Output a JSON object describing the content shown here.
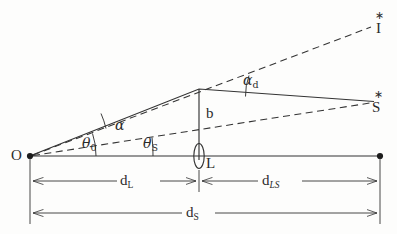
{
  "figure": {
    "type": "gravitational-lensing-geometry-diagram",
    "background_color": "#fdfdfc",
    "stroke_color": "#333333"
  },
  "points": {
    "observer": {
      "label": "O",
      "x": 30,
      "y": 156,
      "marker": "filled-dot"
    },
    "lens": {
      "label": "L",
      "x": 199,
      "y": 156,
      "marker": "ellipse"
    },
    "source": {
      "label": "S",
      "x": 378,
      "y": 100,
      "marker": "star"
    },
    "image": {
      "label": "I",
      "x": 378,
      "y": 22,
      "marker": "star"
    },
    "axis_end": {
      "label": "",
      "x": 380,
      "y": 156,
      "marker": "filled-dot"
    },
    "bend": {
      "label": "",
      "x": 199,
      "y": 89,
      "marker": "none"
    }
  },
  "angles": {
    "alpha": "α",
    "alpha_d_base": "α",
    "alpha_d_sub": "d",
    "theta_0_base": "θ",
    "theta_0_sub": "0",
    "theta_s_base": "θ",
    "theta_s_sub": "S"
  },
  "lengths": {
    "impact_parameter": "b",
    "d_L_base": "d",
    "d_L_sub": "L",
    "d_LS_base": "d",
    "d_LS_sub": "LS",
    "d_S_base": "d",
    "d_S_sub": "S"
  },
  "markers": {
    "star_glyph": "∗"
  },
  "lines": {
    "optic_axis": {
      "style": "solid",
      "from": "observer",
      "to": "axis_end"
    },
    "deflected_ray_in": {
      "style": "solid",
      "from": "observer",
      "to": "bend"
    },
    "deflected_ray_out": {
      "style": "solid",
      "from": "bend",
      "to": "source"
    },
    "true_source_line": {
      "style": "dashed",
      "from": "observer",
      "to": "source"
    },
    "apparent_image_line": {
      "style": "dashed",
      "from": "observer",
      "to": "image"
    },
    "impact_parameter_line": {
      "style": "solid",
      "from": "bend",
      "to": "lens"
    }
  }
}
